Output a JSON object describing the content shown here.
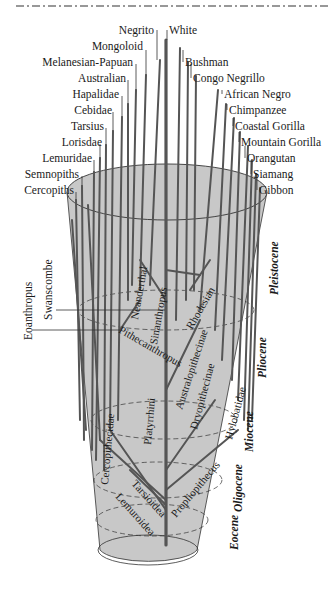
{
  "diagram": {
    "colors": {
      "cone_fill": "#c8c8c8",
      "branch": "#555555",
      "leader_line": "#333333",
      "text": "#1a1a1a",
      "background": "#ffffff"
    },
    "top_leaves_left": [
      {
        "label": "Negrito"
      },
      {
        "label": "Mongoloid"
      },
      {
        "label": "Melanesian-Papuan"
      },
      {
        "label": "Australian"
      },
      {
        "label": "Hapalidae"
      },
      {
        "label": "Cebidae"
      },
      {
        "label": "Tarsius"
      },
      {
        "label": "Lorisdae"
      },
      {
        "label": "Lemuridae"
      },
      {
        "label": "Semnopiths"
      },
      {
        "label": "Cercopiths"
      }
    ],
    "top_leaves_right": [
      {
        "label": "White"
      },
      {
        "label": "Bushman"
      },
      {
        "label": "Congo Negrillo"
      },
      {
        "label": "African Negro"
      },
      {
        "label": "Chimpanzee"
      },
      {
        "label": "Coastal Gorilla"
      },
      {
        "label": "Mountain Gorilla"
      },
      {
        "label": "Orangutan"
      },
      {
        "label": "Siamang"
      },
      {
        "label": "Gibbon"
      }
    ],
    "side_labels": {
      "eoanthropus": "Eoanthropus",
      "swanscombe": "Swanscombe"
    },
    "inner_labels": {
      "neanderthal": "Neanderthal",
      "sinanthropus": "Sinanthropus",
      "rhodesian": "Rhodesian",
      "pithecanthropus": "Pithecanthropus",
      "australopithecinae": "Australopithecinae",
      "dryopithecinae": "Dryopithecinae",
      "hylobatidae": "Hylobatidae",
      "platyrrhini": "Platyrrhini",
      "cercopithecidae": "Cercopithecidae",
      "propliopithecus": "Propliopithecus",
      "tarsioidea": "Tarsioidea",
      "lemuroidea": "Lemuroidea"
    },
    "epochs": [
      {
        "label": "Pleistocene"
      },
      {
        "label": "Pliocene"
      },
      {
        "label": "Miocene"
      },
      {
        "label": "Oligocene"
      },
      {
        "label": "Eocene"
      }
    ]
  }
}
